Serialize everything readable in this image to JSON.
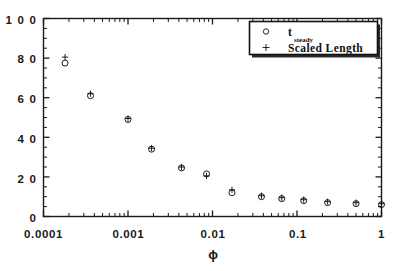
{
  "chart_data": {
    "type": "scatter",
    "title": "",
    "xlabel": "ϕ",
    "ylabel": "",
    "xscale": "log",
    "yscale": "linear",
    "xlim": [
      0.0001,
      1
    ],
    "ylim": [
      0,
      100
    ],
    "grid": false,
    "legend_position": "top-right",
    "xtick_labels": [
      "0.0001",
      "0.001",
      "0.01",
      "0.1",
      "1"
    ],
    "xtick_values": [
      0.0001,
      0.001,
      0.01,
      0.1,
      1
    ],
    "ytick_labels": [
      "0",
      "20",
      "40",
      "60",
      "80",
      "100"
    ],
    "ytick_values": [
      0,
      20,
      40,
      60,
      80,
      100
    ],
    "yminor_step": 5,
    "x": [
      0.00018,
      0.00036,
      0.001,
      0.0019,
      0.0043,
      0.0085,
      0.017,
      0.038,
      0.066,
      0.12,
      0.23,
      0.5,
      1.0
    ],
    "series": [
      {
        "name": "t_steady",
        "label": "t",
        "label_sub": "steady",
        "marker": "circle",
        "color": "#111111",
        "values": [
          77.5,
          61.0,
          49.0,
          34.0,
          24.5,
          21.5,
          12.0,
          10.0,
          9.0,
          8.0,
          7.0,
          6.5,
          6.0
        ]
      },
      {
        "name": "Scaled Length",
        "label": "Scaled Length",
        "marker": "plus",
        "color": "#111111",
        "values": [
          80.5,
          62.0,
          49.5,
          34.5,
          25.0,
          20.5,
          13.5,
          10.5,
          9.5,
          8.5,
          7.5,
          7.0,
          6.5
        ]
      }
    ]
  },
  "legend": {
    "entries": [
      {
        "marker": "circle",
        "label": "t",
        "sub": "steady"
      },
      {
        "marker": "plus",
        "label": "Scaled Length",
        "sub": ""
      }
    ]
  },
  "axes": {
    "x_axis_title": "ϕ",
    "x_tick_0": "0.0001",
    "x_tick_1": "0.001",
    "x_tick_2": "0.01",
    "x_tick_3": "0.1",
    "x_tick_4": "1",
    "y_tick_0": "0",
    "y_tick_1": "2 0",
    "y_tick_2": "4 0",
    "y_tick_3": "6 0",
    "y_tick_4": "8 0",
    "y_tick_5": "1 0 0"
  },
  "colors": {
    "frame": "#1a1a1a",
    "marker": "#111111",
    "background": "#ffffff",
    "legend_border": "#111111",
    "legend_shadow": "#2b2b2b"
  }
}
